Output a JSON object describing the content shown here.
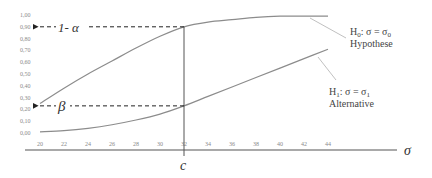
{
  "chart_data": {
    "type": "line",
    "title": "",
    "xlabel": "σ",
    "ylabel": "",
    "x": [
      20,
      22,
      24,
      26,
      28,
      30,
      32,
      34,
      36,
      38,
      40,
      42,
      44
    ],
    "x_tick_labels": [
      "20",
      "22",
      "24",
      "26",
      "28",
      "30",
      "32",
      "34",
      "36",
      "38",
      "40",
      "42",
      "44"
    ],
    "y_tick_labels": [
      "0,00",
      "0,10",
      "0,20",
      "0,30",
      "0,40",
      "0,50",
      "0,60",
      "0,70",
      "0,80",
      "0,90",
      "1,00"
    ],
    "ylim": [
      0,
      1
    ],
    "xlim": [
      20,
      44
    ],
    "grid": false,
    "series": [
      {
        "name": "H0: σ = σ0 Hypothese",
        "values": [
          0.25,
          0.38,
          0.5,
          0.61,
          0.72,
          0.82,
          0.9,
          0.94,
          0.96,
          0.98,
          0.99,
          0.99,
          0.99
        ]
      },
      {
        "name": "H1: σ = σ1 Alternative",
        "values": [
          0.01,
          0.02,
          0.04,
          0.07,
          0.11,
          0.16,
          0.23,
          0.31,
          0.39,
          0.47,
          0.55,
          0.63,
          0.71
        ]
      }
    ],
    "annotations": [
      {
        "text": "1- α",
        "y": 0.9,
        "type": "dashed-arrow-to-y-axis"
      },
      {
        "text": "β",
        "y": 0.23,
        "type": "dashed-arrow-to-y-axis"
      },
      {
        "text": "c",
        "x": 32,
        "type": "vertical-line-marker"
      }
    ]
  },
  "labels": {
    "h0_line1_prefix": "H",
    "h0_sub": "0",
    "h0_line1_rest": ": σ = σ",
    "h0_line1_sub2": "0",
    "h0_line2": "Hypothese",
    "h1_line1_prefix": "H",
    "h1_sub": "1",
    "h1_line1_rest": ": σ = σ",
    "h1_line1_sub2": "1",
    "h1_line2": "Alternative",
    "alpha": "1- α",
    "beta": "β",
    "c": "c",
    "sigma": "σ"
  }
}
